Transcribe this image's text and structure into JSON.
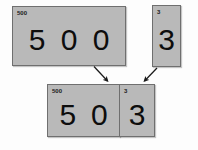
{
  "diagram": {
    "background_color": "#fdfdfd",
    "card_fill_color": "#b9b9b9",
    "card_border_color": "#6f6f6f",
    "digit_color": "#0d0d0d",
    "cards": [
      {
        "id": "hundreds-source",
        "label": "500",
        "digits": [
          "5",
          "0",
          "0"
        ]
      },
      {
        "id": "ones-source",
        "label": "3",
        "digits": [
          "3"
        ]
      },
      {
        "id": "hundreds-result",
        "label": "500",
        "digits": [
          "5",
          "0"
        ]
      },
      {
        "id": "ones-result",
        "label": "3",
        "digits": [
          "3"
        ]
      }
    ],
    "arrows": [
      {
        "id": "arrow-hundreds-to-result",
        "direction": "down-right"
      },
      {
        "id": "arrow-ones-to-result",
        "direction": "down-left"
      }
    ]
  }
}
